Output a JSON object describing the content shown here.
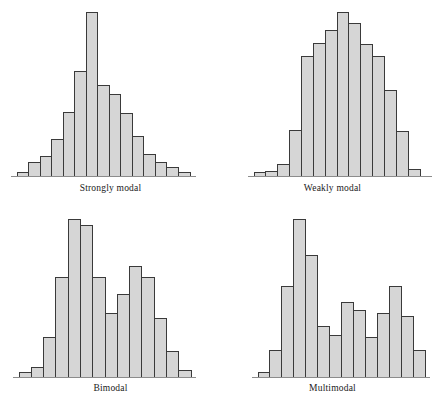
{
  "figure": {
    "title": "",
    "background_color": "#ffffff",
    "bar_fill_color": "#d6d6d6",
    "bar_edge_color": "#3a3a3a",
    "axis_color": "#8c8c8c",
    "label_color": "#1a1a1a"
  },
  "panels": [
    {
      "id": "strongly-modal",
      "label": "Strongly modal"
    },
    {
      "id": "weakly-modal",
      "label": "Weakly modal"
    },
    {
      "id": "bimodal",
      "label": "Bimodal"
    },
    {
      "id": "multimodal",
      "label": "Multimodal"
    }
  ],
  "chart_data": [
    {
      "type": "bar",
      "title": "Strongly modal",
      "xlabel": "",
      "ylabel": "",
      "grid": false,
      "legend": "none",
      "axis": "baseline-only",
      "n_bins": 15,
      "categories": [
        "1",
        "2",
        "3",
        "4",
        "5",
        "6",
        "7",
        "8",
        "9",
        "10",
        "11",
        "12",
        "13",
        "14",
        "15"
      ],
      "values": [
        2,
        8,
        12,
        22,
        39,
        64,
        100,
        55,
        50,
        38,
        24,
        13,
        8,
        5,
        2
      ],
      "ylim": [
        0,
        100
      ]
    },
    {
      "type": "bar",
      "title": "Weakly modal",
      "xlabel": "",
      "ylabel": "",
      "grid": false,
      "legend": "none",
      "axis": "baseline-only",
      "n_bins": 14,
      "categories": [
        "1",
        "2",
        "3",
        "4",
        "5",
        "6",
        "7",
        "8",
        "9",
        "10",
        "11",
        "12",
        "13",
        "14"
      ],
      "values": [
        2,
        3,
        7,
        28,
        73,
        81,
        89,
        100,
        93,
        80,
        73,
        52,
        27,
        4
      ],
      "ylim": [
        0,
        100
      ]
    },
    {
      "type": "bar",
      "title": "Bimodal",
      "xlabel": "",
      "ylabel": "",
      "grid": false,
      "legend": "none",
      "axis": "baseline-only",
      "n_bins": 14,
      "categories": [
        "1",
        "2",
        "3",
        "4",
        "5",
        "6",
        "7",
        "8",
        "9",
        "10",
        "11",
        "12",
        "13",
        "14"
      ],
      "values": [
        3,
        6,
        25,
        63,
        100,
        96,
        63,
        40,
        52,
        70,
        63,
        37,
        16,
        4
      ],
      "ylim": [
        0,
        100
      ]
    },
    {
      "type": "bar",
      "title": "Multimodal",
      "xlabel": "",
      "ylabel": "",
      "grid": false,
      "legend": "none",
      "axis": "baseline-only",
      "n_bins": 13,
      "categories": [
        "1",
        "2",
        "3",
        "4",
        "5",
        "6",
        "7",
        "8",
        "9",
        "10",
        "11",
        "12",
        "13"
      ],
      "values": [
        3,
        17,
        57,
        100,
        77,
        32,
        26,
        47,
        42,
        25,
        40,
        57,
        38,
        17
      ],
      "ylim": [
        0,
        100
      ]
    }
  ]
}
